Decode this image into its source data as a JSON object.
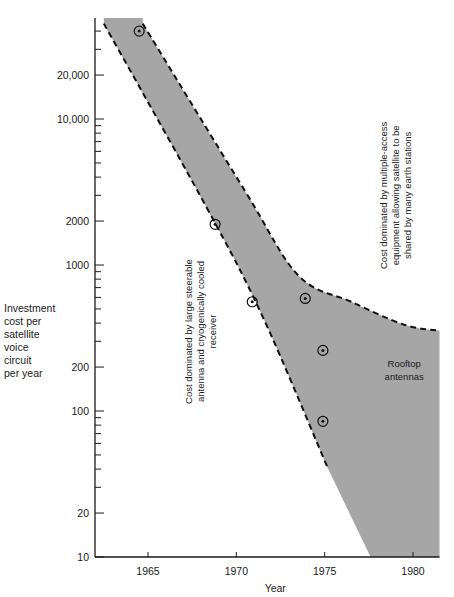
{
  "chart_data": {
    "type": "area",
    "title": "",
    "xlabel": "Year",
    "ylabel": [
      "Investment",
      "cost per",
      "satellite",
      "voice",
      "circuit",
      "per year"
    ],
    "yscale": "log",
    "ylim": [
      10,
      40000
    ],
    "xlim": [
      1962.3,
      1981.5
    ],
    "x_ticks": [
      1965,
      1970,
      1975,
      1980
    ],
    "x_tick_labels": [
      "1965",
      "1970",
      "1975",
      "1980"
    ],
    "y_ticks": [
      10,
      20,
      100,
      200,
      1000,
      2000,
      10000,
      20000
    ],
    "y_tick_labels": [
      "10",
      "20",
      "100",
      "200",
      "1000",
      "2000",
      "10,000",
      "20,000"
    ],
    "grid": false,
    "points": [
      {
        "year": 1964.5,
        "value": 40000
      },
      {
        "year": 1968.8,
        "value": 1900
      },
      {
        "year": 1970.9,
        "value": 560
      },
      {
        "year": 1973.9,
        "value": 590
      },
      {
        "year": 1974.9,
        "value": 260
      },
      {
        "year": 1974.9,
        "value": 85
      }
    ],
    "band": {
      "fill": "#a6a6a6",
      "lower_dashed": [
        [
          1962.5,
          45000
        ],
        [
          1968.3,
          2500
        ],
        [
          1971.5,
          440
        ],
        [
          1975.2,
          40
        ]
      ],
      "lower_solid": [
        [
          1975.2,
          40
        ],
        [
          1977.6,
          10
        ]
      ],
      "upper_dashed": [
        [
          1964.7,
          45000
        ],
        [
          1970.5,
          3200
        ],
        [
          1973.5,
          850
        ],
        [
          1976.5,
          560
        ],
        [
          1979.5,
          390
        ],
        [
          1981.5,
          355
        ]
      ],
      "right_edge_year": 1981.5
    },
    "annotations": [
      {
        "text": [
          "Cost dominated by large steerable",
          "antenna and cryogenically cooled",
          "receiver"
        ],
        "rotation": -90,
        "year": 1967.5,
        "value": 350
      },
      {
        "text": [
          "Cost dominated by multiple-access",
          "equipment allowing satellite to be",
          "shared by many earth stations"
        ],
        "rotation": -90,
        "year": 1978.5,
        "value": 3000
      },
      {
        "text": [
          "Rooftop",
          "antennas"
        ],
        "rotation": 0,
        "year": 1979.5,
        "value": 200
      }
    ],
    "colors": {
      "band": "#a6a6a6",
      "axis": "#1a1a1a",
      "dash": "#111111"
    }
  }
}
